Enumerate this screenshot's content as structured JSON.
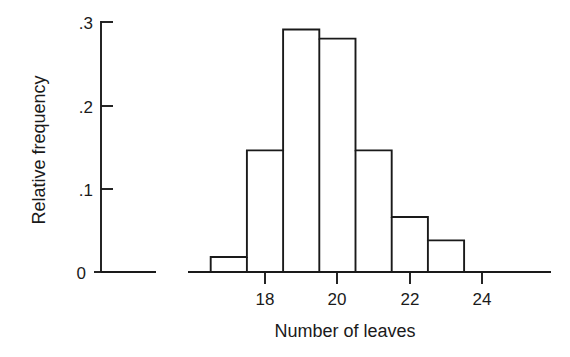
{
  "chart_data": {
    "type": "bar",
    "title": "",
    "subtitle": "",
    "xlabel": "Number of leaves",
    "ylabel": "Relative frequency",
    "categories": [
      "16.5-17.5",
      "17.5-18.5",
      "18.5-19.5",
      "19.5-20.5",
      "20.5-21.5",
      "21.5-22.5",
      "22.5-23.5"
    ],
    "bin_edges": [
      16.5,
      17.5,
      18.5,
      19.5,
      20.5,
      21.5,
      22.5,
      23.5
    ],
    "values": [
      0.018,
      0.146,
      0.291,
      0.28,
      0.146,
      0.066,
      0.038
    ],
    "xlim": [
      16.0,
      24.9
    ],
    "ylim": [
      0,
      0.3
    ],
    "xticks": [
      18,
      20,
      22,
      24
    ],
    "xtick_labels": [
      "18",
      "20",
      "22",
      "24"
    ],
    "yticks": [
      0,
      0.1,
      0.2,
      0.3
    ],
    "ytick_labels": [
      "0",
      ".1",
      ".2",
      ".3"
    ],
    "grid": false,
    "legend": false,
    "legend_position": "none",
    "bar_fill": "#ffffff",
    "bar_stroke": "#1a1a1a",
    "axis_color": "#1a1a1a",
    "background": "#ffffff",
    "bars_outlined_only": true,
    "axis_style": "broken-left-gap"
  },
  "axes": {
    "y_axis_label": "Relative frequency",
    "x_axis_label": "Number of leaves",
    "y_tick_labels": [
      ".3",
      ".2",
      ".1",
      "0"
    ],
    "x_tick_labels": [
      "18",
      "20",
      "22",
      "24"
    ]
  }
}
